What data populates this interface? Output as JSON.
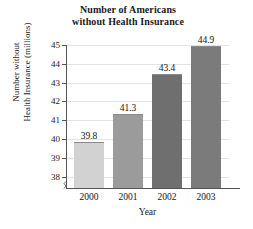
{
  "chart_data": {
    "type": "bar",
    "title": "Number of Americans without Health Insurance",
    "title_lines": [
      "Number of Americans",
      "without Health Insurance"
    ],
    "xlabel": "Year",
    "ylabel": "Number without Health Insurance (millions)",
    "ylabel_lines": [
      "Number without",
      "Health Insurance (millions)"
    ],
    "categories": [
      "2000",
      "2001",
      "2002",
      "2003"
    ],
    "values": [
      39.8,
      41.3,
      43.4,
      44.9
    ],
    "value_labels": [
      "39.8",
      "41.3",
      "43.4",
      "44.9"
    ],
    "ylim": [
      37.4,
      45
    ],
    "yticks": [
      "38",
      "39",
      "40",
      "41",
      "42",
      "43",
      "44",
      "45"
    ],
    "ytick_values": [
      38,
      39,
      40,
      41,
      42,
      43,
      44,
      45
    ],
    "grid": true,
    "legend": "none",
    "axis_break": true,
    "bar_colors": [
      "#d2d2d2",
      "#9b9b9b",
      "#6f6f6f",
      "#7b7b7b"
    ],
    "bar_border_color": "#8a8a8a",
    "grid_color": "#e3e3e3",
    "axis_color": "#555555"
  }
}
